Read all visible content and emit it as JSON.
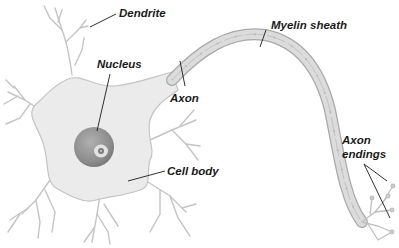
{
  "diagram": {
    "colors": {
      "cell": "#ebebeb",
      "cell_outline": "#c4c4c4",
      "nucleus": "#8f8f8f",
      "nucleus_light": "#bdbdbd",
      "nucleolus": "#e2e2e2",
      "myelin": "#dcdcdc",
      "myelin_outline": "#a9a9a9",
      "leader_line": "#1a1a1a",
      "label_text": "#1a1a1a"
    },
    "labels": {
      "dendrite": "Dendrite",
      "nucleus": "Nucleus",
      "myelin_sheath": "Myelin sheath",
      "axon": "Axon",
      "cell_body": "Cell body",
      "axon_endings_line1": "Axon",
      "axon_endings_line2": "endings"
    }
  }
}
